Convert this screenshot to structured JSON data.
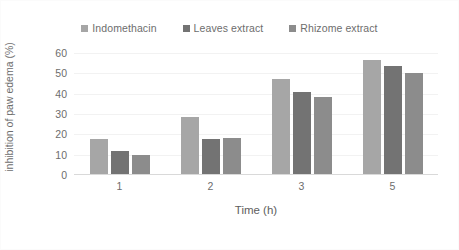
{
  "chart_data": {
    "type": "bar",
    "title": "",
    "xlabel": "Time (h)",
    "ylabel": "inhibition of paw edema (%)",
    "categories": [
      "1",
      "2",
      "3",
      "5"
    ],
    "ylim": [
      0,
      60
    ],
    "yticks": [
      0,
      10,
      20,
      30,
      40,
      50,
      60
    ],
    "grid": true,
    "legend_position": "top-center",
    "series": [
      {
        "name": "Indomethacin",
        "color": "#a6a6a6",
        "values": [
          17,
          28,
          46.5,
          56
        ]
      },
      {
        "name": "Leaves extract",
        "color": "#737373",
        "values": [
          11.3,
          17,
          40.5,
          53
        ]
      },
      {
        "name": "Rhizome extract",
        "color": "#8c8c8c",
        "values": [
          9.3,
          17.8,
          37.8,
          49.5
        ]
      }
    ]
  },
  "colors": {
    "series_1": "#a6a6a6",
    "series_2": "#737373",
    "series_3": "#8c8c8c",
    "gridline": "#f2f2f2",
    "axis": "#d9d9d9",
    "text": "#6d6d6d",
    "background": "#ffffff"
  }
}
